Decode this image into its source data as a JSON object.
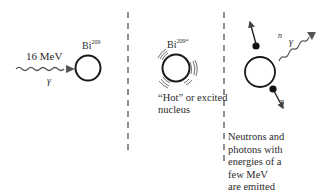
{
  "panels": [
    {
      "id": "incoming",
      "energy_label": "16 MeV",
      "particle_label": "γ",
      "nucleus_label": "Bi",
      "nucleus_superscript": "209"
    },
    {
      "id": "excited",
      "nucleus_label": "Bi",
      "nucleus_superscript": "209*",
      "caption_line1": "“Hot” or excited",
      "caption_line2": "nucleus"
    },
    {
      "id": "emission",
      "neutron_label_top": "n",
      "neutron_label_bottom": "n",
      "photon_label": "γ",
      "caption_lines": [
        "Neutrons and",
        "photons with",
        "energies of a",
        "few MeV",
        "are emitted"
      ]
    }
  ],
  "colors": {
    "stroke": "#1a1a1a",
    "dash": "#333333",
    "wave": "#555555"
  }
}
